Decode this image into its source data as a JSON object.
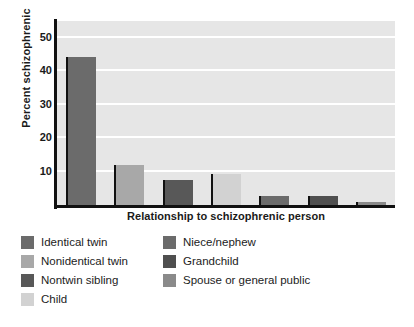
{
  "chart_data": {
    "type": "bar",
    "title": "",
    "xlabel": "Relationship to schizophrenic person",
    "ylabel": "Percent schizophrenic",
    "categories": [
      "Identical twin",
      "Nonidentical twin",
      "Nontwin sibling",
      "Child",
      "Niece/nephew",
      "Grandchild",
      "Spouse or general public"
    ],
    "values": [
      44.3,
      12.1,
      7.4,
      9.4,
      2.6,
      2.6,
      1.0
    ],
    "colors": [
      "#6b6b6b",
      "#a8a8a8",
      "#585858",
      "#d2d2d2",
      "#6b6b6b",
      "#4f4f4f",
      "#8a8a8a"
    ],
    "ylim": [
      0,
      55
    ],
    "yticks": [
      10,
      20,
      30,
      40,
      50
    ],
    "ytick_labels": [
      "10",
      "20",
      "30",
      "40",
      "50"
    ],
    "grid": true,
    "grid_color": "#ffffff",
    "plot_background": "#e6e6e6",
    "axis_color": "#111111",
    "legend_position": "below",
    "legend": [
      {
        "label": "Identical twin",
        "color": "#6b6b6b"
      },
      {
        "label": "Nonidentical twin",
        "color": "#a8a8a8"
      },
      {
        "label": "Nontwin sibling",
        "color": "#585858"
      },
      {
        "label": "Child",
        "color": "#d2d2d2"
      },
      {
        "label": "Niece/nephew",
        "color": "#6b6b6b"
      },
      {
        "label": "Grandchild",
        "color": "#4f4f4f"
      },
      {
        "label": "Spouse or general public",
        "color": "#8a8a8a"
      }
    ]
  }
}
